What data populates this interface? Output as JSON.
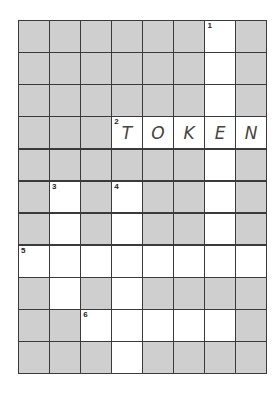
{
  "puzzle": {
    "cols": 8,
    "rows": 11,
    "colors": {
      "block": "#cfcfcf",
      "open": "#ffffff",
      "line": "#3a3a3a",
      "letter": "#444444"
    },
    "grid": [
      [
        "B",
        "B",
        "B",
        "B",
        "B",
        "B",
        "W",
        "B"
      ],
      [
        "B",
        "B",
        "B",
        "B",
        "B",
        "B",
        "W",
        "B"
      ],
      [
        "B",
        "B",
        "B",
        "B",
        "B",
        "B",
        "W",
        "B"
      ],
      [
        "B",
        "B",
        "B",
        "W",
        "W",
        "W",
        "W",
        "W"
      ],
      [
        "B",
        "B",
        "B",
        "B",
        "B",
        "B",
        "W",
        "B"
      ],
      [
        "B",
        "W",
        "B",
        "W",
        "B",
        "B",
        "W",
        "B"
      ],
      [
        "B",
        "W",
        "B",
        "W",
        "B",
        "B",
        "W",
        "B"
      ],
      [
        "W",
        "W",
        "W",
        "W",
        "W",
        "W",
        "W",
        "W"
      ],
      [
        "B",
        "W",
        "B",
        "W",
        "B",
        "B",
        "B",
        "B"
      ],
      [
        "B",
        "B",
        "W",
        "W",
        "W",
        "W",
        "W",
        "B"
      ],
      [
        "B",
        "B",
        "B",
        "W",
        "B",
        "B",
        "B",
        "B"
      ]
    ],
    "numbers": [
      {
        "row": 0,
        "col": 6,
        "n": "1"
      },
      {
        "row": 3,
        "col": 3,
        "n": "2"
      },
      {
        "row": 5,
        "col": 1,
        "n": "3"
      },
      {
        "row": 5,
        "col": 3,
        "n": "4"
      },
      {
        "row": 7,
        "col": 0,
        "n": "5"
      },
      {
        "row": 9,
        "col": 2,
        "n": "6"
      }
    ],
    "letters": [
      {
        "row": 3,
        "col": 3,
        "ch": "T"
      },
      {
        "row": 3,
        "col": 4,
        "ch": "O"
      },
      {
        "row": 3,
        "col": 5,
        "ch": "K"
      },
      {
        "row": 3,
        "col": 6,
        "ch": "E"
      },
      {
        "row": 3,
        "col": 7,
        "ch": "N"
      }
    ],
    "filled_answers": [
      {
        "clue": "2",
        "direction": "across",
        "answer": "TOKEN"
      }
    ]
  }
}
